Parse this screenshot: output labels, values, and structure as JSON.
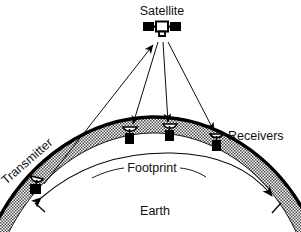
{
  "diagram": {
    "title_text": "Satellite communication footprint diagram",
    "background_color": "#ffffff",
    "ink_color": "#000000",
    "band_fill_color": "#a8a8a8",
    "labels": {
      "satellite": "Satellite",
      "receivers": "Receivers",
      "transmitter": "Transmitter",
      "footprint": "Footprint",
      "earth": "Earth"
    },
    "nodes": [
      {
        "id": "satellite",
        "name": "satellite-icon",
        "label": "Satellite",
        "x": 160,
        "y": 30
      },
      {
        "id": "transmitter",
        "name": "transmitter-station",
        "label": "Transmitter",
        "x": 40,
        "y": 188
      },
      {
        "id": "receiver-1",
        "name": "receiver-station-1",
        "label": "Receivers",
        "x": 130,
        "y": 135
      },
      {
        "id": "receiver-2",
        "name": "receiver-station-2",
        "label": "Receivers",
        "x": 170,
        "y": 132
      },
      {
        "id": "receiver-3",
        "name": "receiver-station-3",
        "label": "Receivers",
        "x": 217,
        "y": 141
      }
    ],
    "signals": [
      {
        "id": "uplink",
        "name": "uplink-signal",
        "from": "transmitter",
        "to": "satellite",
        "direction": "up"
      },
      {
        "id": "downlink-1",
        "name": "downlink-signal-1",
        "from": "satellite",
        "to": "receiver-1",
        "direction": "down"
      },
      {
        "id": "downlink-2",
        "name": "downlink-signal-2",
        "from": "satellite",
        "to": "receiver-2",
        "direction": "down"
      },
      {
        "id": "downlink-3",
        "name": "downlink-signal-3",
        "from": "satellite",
        "to": "receiver-3",
        "direction": "down"
      }
    ],
    "footprint_extent": {
      "left_marker_x": 45,
      "right_marker_x": 265,
      "label": "Footprint"
    }
  }
}
